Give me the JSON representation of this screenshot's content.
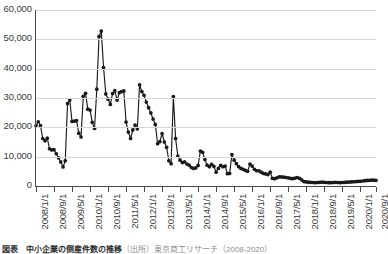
{
  "chart_data": {
    "type": "line",
    "title": "",
    "subtitle": "",
    "xlabel": "",
    "ylabel": "",
    "ylim": [
      0,
      60000
    ],
    "ytick_labels": [
      "60,000",
      "50,000",
      "40,000",
      "30,000",
      "20,000",
      "10,000",
      "0"
    ],
    "ytick_values": [
      60000,
      50000,
      40000,
      30000,
      20000,
      10000,
      0
    ],
    "grid": "horizontal",
    "legend": "none",
    "marker": "filled-circle",
    "line_color": "#1a1a1a",
    "marker_color": "#1a1a1a",
    "gridline_color": "#d6d6d6",
    "axis_color": "#4a4a4a",
    "xtick_labels": [
      "2008/1/1",
      "2008/9/1",
      "2009/5/1",
      "2010/1/1",
      "2010/9/1",
      "2011/5/1",
      "2012/1/1",
      "2012/9/1",
      "2013/5/1",
      "2014/1/1",
      "2014/9/1",
      "2015/5/1",
      "2016/1/1",
      "2016/9/1",
      "2017/5/1",
      "2018/1/1",
      "2018/9/1",
      "2019/5/1",
      "2020/1/1",
      "2020/9/1"
    ],
    "xtick_interval_months": 8,
    "x_start": "2008/1/1",
    "x_end": "2020/10/1",
    "x_frequency": "monthly",
    "values": [
      20500,
      21900,
      20600,
      16200,
      15400,
      16300,
      12700,
      12300,
      12400,
      11000,
      9600,
      8200,
      6500,
      8600,
      28100,
      29300,
      22000,
      22100,
      22300,
      18000,
      16700,
      30600,
      31600,
      26200,
      25900,
      21700,
      19600,
      33000,
      51000,
      52800,
      40400,
      31400,
      29600,
      27800,
      31500,
      32500,
      29300,
      31800,
      32200,
      32400,
      21800,
      18400,
      16200,
      19100,
      20800,
      19500,
      34500,
      32200,
      30900,
      28600,
      26700,
      24900,
      22800,
      21000,
      14400,
      15100,
      17900,
      15000,
      13200,
      8600,
      7600,
      30500,
      16200,
      10200,
      8800,
      8000,
      8200,
      7500,
      7100,
      6300,
      6000,
      6200,
      7000,
      11900,
      11500,
      9000,
      7100,
      6600,
      7400,
      6700,
      4700,
      6000,
      7000,
      6600,
      6800,
      4200,
      4300,
      10700,
      8800,
      7600,
      6600,
      6000,
      5700,
      5300,
      5000,
      7500,
      6800,
      5700,
      5200,
      5200,
      4700,
      4300,
      4100,
      3900,
      4700,
      2600,
      2500,
      2800,
      3100,
      3100,
      3000,
      2900,
      2800,
      2600,
      2500,
      2700,
      2900,
      2600,
      2100,
      1500,
      1400,
      1300,
      1250,
      1200,
      1150,
      1200,
      1250,
      1300,
      1250,
      1200,
      1150,
      1150,
      1200,
      1250,
      1200,
      1150,
      1200,
      1250,
      1300,
      1350,
      1400,
      1450,
      1500,
      1550,
      1600,
      1700,
      1800,
      1900,
      1950,
      2000,
      2000,
      1950
    ]
  },
  "caption": {
    "prefix": "図表",
    "body": "　中小企業の倒産件数の推移",
    "source": "（出所）東京商工リサーチ（2008-2020）"
  }
}
